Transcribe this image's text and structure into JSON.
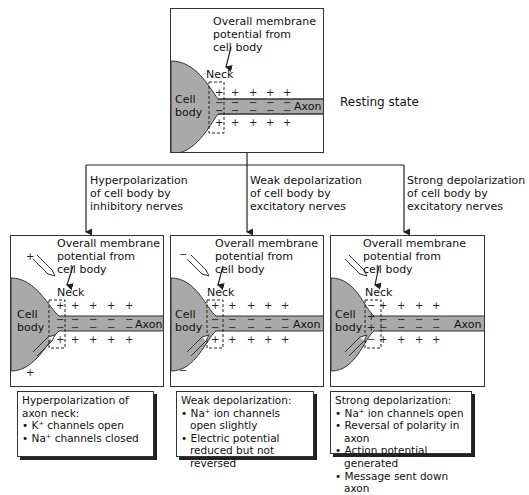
{
  "resting": {
    "membrane_label": [
      "Overall membrane",
      "potential from",
      "cell body"
    ],
    "neck_label": "Neck",
    "cell_body_label": [
      "Cell",
      "body"
    ],
    "axon_label": "Axon",
    "state_label": "Resting state"
  },
  "branches": [
    {
      "condition": [
        "Hyperpolarization",
        "of cell body by",
        "inhibitory nerves"
      ],
      "membrane_label": [
        "Overall membrane",
        "potential from",
        "cell body"
      ],
      "neck_label": "Neck",
      "cell_body_label": [
        "Cell",
        "body"
      ],
      "axon_label": "Axon",
      "note_title": [
        "Hyperpolarization of",
        "axon neck:"
      ],
      "note_items": [
        "K⁺ channels open",
        "Na⁺ channels closed"
      ]
    },
    {
      "condition": [
        "Weak depolarization",
        "of cell body by",
        "excitatory nerves"
      ],
      "membrane_label": [
        "Overall membrane",
        "potential from",
        "cell body"
      ],
      "neck_label": "Neck",
      "cell_body_label": [
        "Cell",
        "body"
      ],
      "axon_label": "Axon",
      "note_title": [
        "Weak depolarization:"
      ],
      "note_items": [
        "Na⁺ ion channels open slightly",
        "Electric potential reduced but not reversed"
      ]
    },
    {
      "condition": [
        "Strong depolarization",
        "of cell body by",
        "excitatory nerves"
      ],
      "membrane_label": [
        "Overall membrane",
        "potential from",
        "cell body"
      ],
      "neck_label": "Neck",
      "cell_body_label": [
        "Cell",
        "body"
      ],
      "axon_label": "Axon",
      "note_title": [
        "Strong depolarization:"
      ],
      "note_items": [
        "Na⁺ ion channels open",
        "Reversal of polarity in axon",
        "Action potential generated",
        "Message sent down axon"
      ]
    }
  ],
  "colors": {
    "cell_fill": "#a9a9a9",
    "line": "#333333"
  }
}
